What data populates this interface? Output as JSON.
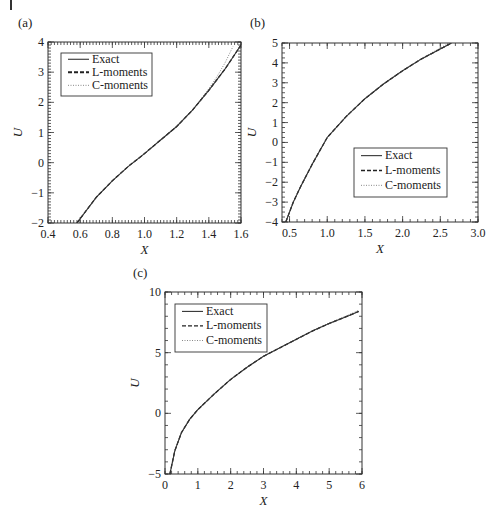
{
  "chart_data": [
    {
      "panel": "(a)",
      "type": "line",
      "title": "",
      "xlabel": "X",
      "ylabel": "U",
      "xlim": [
        0.4,
        1.6
      ],
      "ylim": [
        -2,
        4
      ],
      "xticks": [
        "0.4",
        "0.6",
        "0.8",
        "1.0",
        "1.2",
        "1.4",
        "1.6"
      ],
      "yticks": [
        "-2",
        "-1",
        "0",
        "1",
        "2",
        "3",
        "4"
      ],
      "grid": false,
      "legend_position": "upper left",
      "series": [
        {
          "name": "Exact",
          "style": "solid",
          "x": [
            0.58,
            0.7,
            0.8,
            0.9,
            1.0,
            1.1,
            1.2,
            1.3,
            1.4,
            1.5,
            1.6
          ],
          "y": [
            -2.0,
            -1.15,
            -0.6,
            -0.12,
            0.3,
            0.75,
            1.2,
            1.75,
            2.4,
            3.1,
            3.9
          ]
        },
        {
          "name": "L-moments",
          "style": "dashed",
          "x": [
            0.58,
            0.7,
            0.8,
            0.9,
            1.0,
            1.1,
            1.2,
            1.3,
            1.4,
            1.5,
            1.6
          ],
          "y": [
            -2.0,
            -1.15,
            -0.6,
            -0.12,
            0.3,
            0.75,
            1.2,
            1.75,
            2.4,
            3.1,
            3.9
          ]
        },
        {
          "name": "C-moments",
          "style": "dotted",
          "x": [
            0.58,
            0.7,
            0.8,
            0.9,
            1.0,
            1.1,
            1.2,
            1.3,
            1.4,
            1.45,
            1.5,
            1.55
          ],
          "y": [
            -2.0,
            -1.15,
            -0.6,
            -0.12,
            0.3,
            0.75,
            1.2,
            1.75,
            2.45,
            2.85,
            3.3,
            3.85
          ]
        }
      ]
    },
    {
      "panel": "(b)",
      "type": "line",
      "title": "",
      "xlabel": "X",
      "ylabel": "U",
      "xlim": [
        0.4,
        3.0
      ],
      "ylim": [
        -4,
        5
      ],
      "xticks": [
        "0.5",
        "1.0",
        "1.5",
        "2.0",
        "2.5",
        "3.0"
      ],
      "yticks": [
        "-4",
        "-3",
        "-2",
        "-1",
        "0",
        "1",
        "2",
        "3",
        "4",
        "5"
      ],
      "grid": false,
      "legend_position": "lower right",
      "series": [
        {
          "name": "Exact",
          "style": "solid",
          "x": [
            0.45,
            0.55,
            0.65,
            0.8,
            1.0,
            1.25,
            1.5,
            1.75,
            2.0,
            2.25,
            2.5,
            2.65
          ],
          "y": [
            -4.0,
            -3.0,
            -2.2,
            -1.1,
            0.25,
            1.3,
            2.2,
            2.95,
            3.6,
            4.2,
            4.7,
            5.0
          ]
        },
        {
          "name": "L-moments",
          "style": "dashed",
          "x": [
            0.45,
            0.55,
            0.65,
            0.8,
            1.0,
            1.25,
            1.5,
            1.75,
            2.0,
            2.25,
            2.5,
            2.65
          ],
          "y": [
            -4.0,
            -3.0,
            -2.2,
            -1.1,
            0.25,
            1.3,
            2.2,
            2.95,
            3.6,
            4.2,
            4.7,
            5.0
          ]
        },
        {
          "name": "C-moments",
          "style": "dotted",
          "x": [
            0.45,
            0.55,
            0.65,
            0.8,
            1.0,
            1.25,
            1.5,
            1.75,
            2.0,
            2.25,
            2.5,
            2.62
          ],
          "y": [
            -4.0,
            -3.0,
            -2.2,
            -1.1,
            0.25,
            1.3,
            2.2,
            2.95,
            3.62,
            4.22,
            4.75,
            5.0
          ]
        }
      ]
    },
    {
      "panel": "(c)",
      "type": "line",
      "title": "",
      "xlabel": "X",
      "ylabel": "U",
      "xlim": [
        0,
        6
      ],
      "ylim": [
        -5,
        10
      ],
      "xticks": [
        "0",
        "1",
        "2",
        "3",
        "4",
        "5",
        "6"
      ],
      "yticks": [
        "-5",
        "0",
        "5",
        "10"
      ],
      "grid": false,
      "legend_position": "upper left",
      "series": [
        {
          "name": "Exact",
          "style": "solid",
          "x": [
            0.15,
            0.3,
            0.5,
            0.75,
            1.0,
            1.5,
            2.0,
            2.5,
            3.0,
            3.5,
            4.0,
            4.5,
            5.0,
            5.5,
            5.9
          ],
          "y": [
            -5.0,
            -3.1,
            -1.6,
            -0.5,
            0.3,
            1.6,
            2.8,
            3.8,
            4.7,
            5.4,
            6.1,
            6.8,
            7.4,
            7.95,
            8.4
          ]
        },
        {
          "name": "L-moments",
          "style": "dashed",
          "x": [
            0.15,
            0.3,
            0.5,
            0.75,
            1.0,
            1.5,
            2.0,
            2.5,
            3.0,
            3.5,
            4.0,
            4.5,
            5.0,
            5.5,
            5.9
          ],
          "y": [
            -5.0,
            -3.1,
            -1.6,
            -0.5,
            0.3,
            1.6,
            2.8,
            3.8,
            4.7,
            5.4,
            6.1,
            6.8,
            7.4,
            7.95,
            8.4
          ]
        },
        {
          "name": "C-moments",
          "style": "dotted",
          "x": [
            0.15,
            0.3,
            0.5,
            0.75,
            1.0,
            1.5,
            2.0,
            2.5,
            3.0,
            3.5,
            4.0,
            4.5,
            5.0,
            5.5,
            5.9
          ],
          "y": [
            -5.0,
            -3.1,
            -1.6,
            -0.5,
            0.3,
            1.6,
            2.8,
            3.8,
            4.7,
            5.4,
            6.1,
            6.8,
            7.45,
            8.0,
            8.5
          ]
        }
      ]
    }
  ],
  "panels": {
    "a": {
      "label": "(a)",
      "legend": [
        "Exact",
        "L-moments",
        "C-moments"
      ],
      "xlabel": "X",
      "ylabel": "U"
    },
    "b": {
      "label": "(b)",
      "legend": [
        "Exact",
        "L-moments",
        "C-moments"
      ],
      "xlabel": "X",
      "ylabel": "U"
    },
    "c": {
      "label": "(c)",
      "legend": [
        "Exact",
        "L-moments",
        "C-moments"
      ],
      "xlabel": "X",
      "ylabel": "U"
    }
  },
  "colors": {
    "line": "#333333",
    "axis": "#333333",
    "background": "#ffffff"
  }
}
